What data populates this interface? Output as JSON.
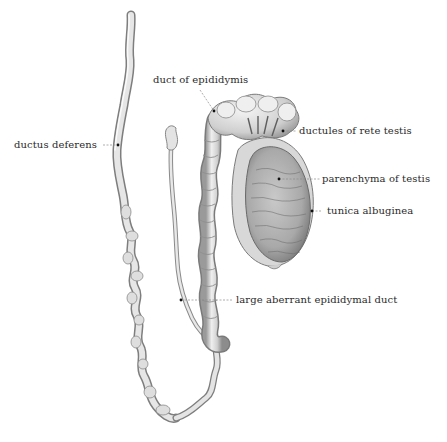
{
  "figure": {
    "colors": {
      "background": "#ffffff",
      "tissue_light": "#e9e9e9",
      "tissue_mid": "#c4c4c4",
      "tissue_dark": "#8a8a8a",
      "outline": "#6e6e6e",
      "leader_line": "#888888",
      "text": "#2a2a2a"
    },
    "labels": [
      {
        "id": "duct-of-epididymis",
        "text": "duct of epididymis"
      },
      {
        "id": "ductus-deferens",
        "text": "ductus deferens"
      },
      {
        "id": "ductules-of-rete-testis",
        "text": "ductules of rete testis"
      },
      {
        "id": "parenchyma-of-testis",
        "text": "parenchyma of testis"
      },
      {
        "id": "tunica-albuginea",
        "text": "tunica albuginea"
      },
      {
        "id": "large-aberrant-epididymal-duct",
        "text": "large aberrant epididymal duct"
      }
    ]
  }
}
